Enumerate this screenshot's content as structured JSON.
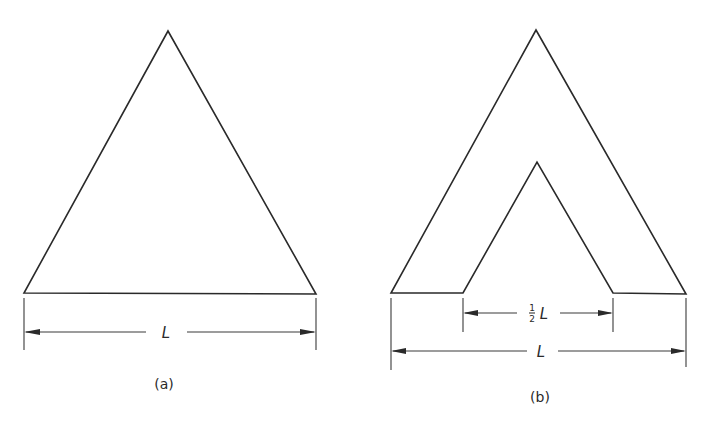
{
  "figure": {
    "panels": [
      {
        "id": "a",
        "caption": "(a)",
        "shape": "solid equilateral triangle",
        "dimensions": [
          {
            "label": "L",
            "measures": "base width"
          }
        ]
      },
      {
        "id": "b",
        "caption": "(b)",
        "shape": "triangle with inner triangular cutout (chevron)",
        "dimensions": [
          {
            "label_fraction_num": "1",
            "label_fraction_den": "2",
            "label_var": "L",
            "measures": "inner cutout base width"
          },
          {
            "label": "L",
            "measures": "outer base width"
          }
        ]
      }
    ],
    "colors": {
      "ink": "#2a2a2a",
      "paper": "#ffffff"
    }
  }
}
